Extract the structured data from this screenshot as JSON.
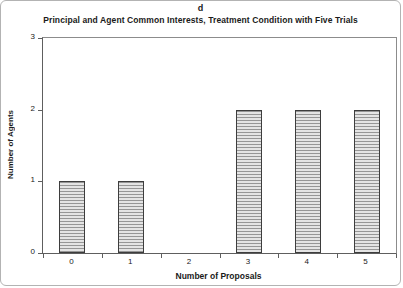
{
  "chart_data": {
    "type": "bar",
    "panel_label": "d",
    "title": "Principal and Agent Common Interests, Treatment Condition with Five Trials",
    "categories": [
      "0",
      "1",
      "2",
      "3",
      "4",
      "5"
    ],
    "values": [
      1,
      1,
      0,
      2,
      2,
      2
    ],
    "xlabel": "Number of Proposals",
    "ylabel": "Number of Agents",
    "ylim": [
      0,
      3
    ],
    "yticks": [
      0,
      1,
      2,
      3
    ],
    "grid": "off",
    "legend": "none",
    "bar_style": {
      "hatch": "horizontal-lines",
      "hatch_color": "#969696",
      "fill": "#e4e4e4",
      "border_color": "#3d3d3d"
    },
    "axis_color": "#5e5e5e",
    "frame_color": "#8c8c8c",
    "background": "#ffffff"
  }
}
